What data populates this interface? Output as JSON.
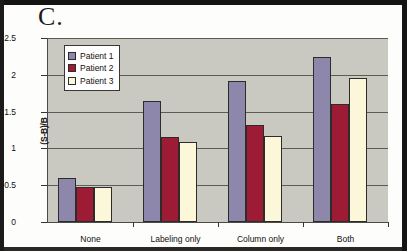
{
  "figure": {
    "panel_label": "C."
  },
  "chart_data": {
    "type": "bar",
    "title": "C.",
    "xlabel": "",
    "ylabel": "(S-B)/B",
    "categories": [
      "None",
      "Labeling only",
      "Column only",
      "Both"
    ],
    "series": [
      {
        "name": "Patient 1",
        "color": "#8d88ab",
        "values": [
          0.6,
          1.64,
          1.92,
          2.24
        ]
      },
      {
        "name": "Patient 2",
        "color": "#9d1b35",
        "values": [
          0.47,
          1.16,
          1.32,
          1.6
        ]
      },
      {
        "name": "Patient 3",
        "color": "#fbf7d8",
        "values": [
          0.47,
          1.09,
          1.17,
          1.96
        ]
      }
    ],
    "ylim": [
      0,
      2.5
    ],
    "yticks": [
      0,
      0.5,
      1,
      1.5,
      2,
      2.5
    ],
    "ytick_labels": [
      "0",
      "0.5",
      "1",
      "1.5",
      "2",
      "2.5"
    ],
    "grid": true,
    "legend_position": "top-left",
    "plot_background": "#c9c9c1"
  }
}
